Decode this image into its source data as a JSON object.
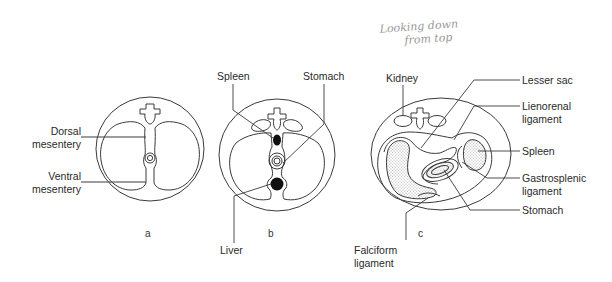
{
  "annotation": {
    "line1": "Looking down",
    "line2": "from top"
  },
  "panels": [
    {
      "id": "a",
      "letter": "a",
      "labels": [
        {
          "key": "dorsal",
          "line1": "Dorsal",
          "line2": "mesentery"
        },
        {
          "key": "ventral",
          "line1": "Ventral",
          "line2": "mesentery"
        }
      ]
    },
    {
      "id": "b",
      "letter": "b",
      "labels": [
        {
          "key": "spleen",
          "text": "Spleen"
        },
        {
          "key": "stomach",
          "text": "Stomach"
        },
        {
          "key": "liver",
          "text": "Liver"
        }
      ]
    },
    {
      "id": "c",
      "letter": "c",
      "labels": [
        {
          "key": "kidney",
          "text": "Kidney"
        },
        {
          "key": "lesser_sac",
          "text": "Lesser sac"
        },
        {
          "key": "lienorenal",
          "line1": "Lienorenal",
          "line2": "ligament"
        },
        {
          "key": "spleen",
          "text": "Spleen"
        },
        {
          "key": "gastrosplenic",
          "line1": "Gastrosplenic",
          "line2": "ligament"
        },
        {
          "key": "stomach",
          "text": "Stomach"
        },
        {
          "key": "falciform",
          "line1": "Falciform",
          "line2": "ligament"
        }
      ]
    }
  ],
  "colors": {
    "line": "#3a3a3a",
    "fill_dark": "#111111",
    "stipple": "#cfcfcf",
    "handwriting": "#9a9a9a"
  }
}
